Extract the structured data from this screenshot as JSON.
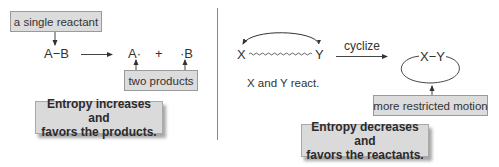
{
  "left_panel": {
    "reactant_label": "a single reactant",
    "reactant": "A−B",
    "product_a": "A·",
    "plus": "+",
    "product_b": "·B",
    "products_label": "two products",
    "conclusion_line1": "Entropy increases and",
    "conclusion_line2": "favors the products."
  },
  "right_panel": {
    "atom_x": "X",
    "atom_y": "Y",
    "chain_caption": "X and Y react.",
    "reaction_label": "cyclize",
    "ring_label": "X−Y",
    "ring_callout": "more restricted motion",
    "conclusion_line1": "Entropy decreases and",
    "conclusion_line2": "favors the reactants."
  },
  "colors": {
    "box_fill": "#dcdcdc",
    "box_border": "#9a9a9a",
    "line": "#444444",
    "divider": "#888888"
  }
}
